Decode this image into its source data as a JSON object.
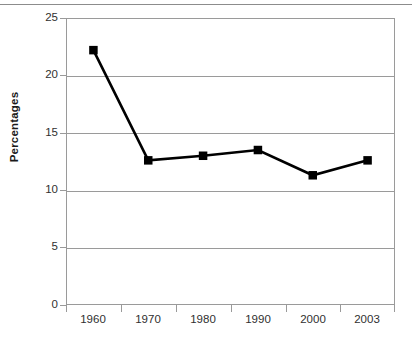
{
  "chart_data": {
    "type": "line",
    "title": "",
    "subtitle": "",
    "xlabel": "",
    "ylabel": "Percentages",
    "categories": [
      "1960",
      "1970",
      "1980",
      "1990",
      "2000",
      "2003"
    ],
    "values": [
      22.2,
      12.6,
      13.0,
      13.5,
      11.3,
      12.6
    ],
    "series": [
      {
        "name": "Percentages",
        "values": [
          22.2,
          12.6,
          13.0,
          13.5,
          11.3,
          12.6
        ]
      }
    ],
    "ylim": [
      0,
      25
    ],
    "yticks": [
      "0",
      "5",
      "10",
      "15",
      "20",
      "25"
    ],
    "ytick_values": [
      0,
      5,
      10,
      15,
      20,
      25
    ],
    "xtick_labels": [
      "1960",
      "1970",
      "1980",
      "1990",
      "2000",
      "2003"
    ],
    "grid": "horizontal",
    "legend": "none",
    "marker": "square",
    "annotations": [],
    "colors": {
      "line": "#000000",
      "marker": "#000000",
      "grid": "#9a9a9a",
      "axis": "#9a9a9a",
      "text": "#303030",
      "label": "#1a1a1a",
      "background": "#ffffff"
    }
  }
}
